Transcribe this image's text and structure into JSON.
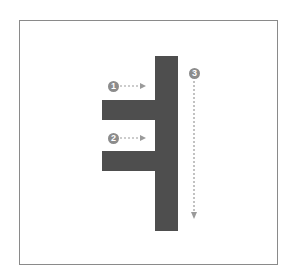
{
  "diagram": {
    "colors": {
      "shape": "#4e4e4e",
      "arrow": "#9a9a9a",
      "badge": "#8c8c8c",
      "frame": "#8a8a8a"
    },
    "callouts": [
      {
        "label": "1",
        "direction": "right"
      },
      {
        "label": "2",
        "direction": "right"
      },
      {
        "label": "3",
        "direction": "down"
      }
    ]
  }
}
